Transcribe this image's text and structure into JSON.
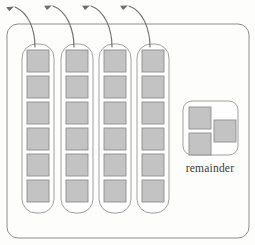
{
  "diagram": {
    "background_color": "#fdfdfc",
    "outer_container": {
      "name": "outer-container",
      "x": 7,
      "y": 24,
      "width": 242,
      "height": 214,
      "corner_radius": 11,
      "stroke": "#8d8d8d",
      "fill": "#fdfdfc"
    },
    "columns": {
      "count": 4,
      "squares_per_column": 6,
      "box_width": 32,
      "box_top": 44,
      "box_height": 169,
      "corner_radius": 14,
      "stroke": "#a0a0a0",
      "x_positions": [
        22,
        61,
        99,
        137
      ],
      "labels": [
        "column-1",
        "column-2",
        "column-3",
        "column-4"
      ],
      "square": {
        "size": 22,
        "gap": 4,
        "inset_x": 5,
        "inset_y": 6,
        "fill": "#c3c3c3",
        "stroke": "#8f8f8f"
      }
    },
    "remainder": {
      "label": "remainder",
      "label_x": 210,
      "label_y": 172,
      "box": {
        "x": 183,
        "y": 101,
        "width": 55,
        "height": 54,
        "corner_radius": 9,
        "stroke": "#a0a0a0",
        "fill": "#fefefe"
      },
      "squares": [
        {
          "name": "remainder-square-1",
          "x": 189,
          "y": 107,
          "size": 22
        },
        {
          "name": "remainder-square-2",
          "x": 189,
          "y": 133,
          "size": 22
        },
        {
          "name": "remainder-square-3",
          "x": 214,
          "y": 120,
          "size": 22
        }
      ],
      "square_count": 3
    },
    "arrows": {
      "count": 4,
      "stroke": "#6e6e6e",
      "description": "curved arrows pointing up-left from each column top",
      "items": [
        {
          "name": "arrow-to-column-1",
          "path": "M 35 47 C 35 30 29 13 15 7",
          "tip_x": 14,
          "tip_y": 6.5,
          "tip_angle": -205
        },
        {
          "name": "arrow-to-column-2",
          "path": "M 74 47 C 74 30 67 11 53 6",
          "tip_x": 52,
          "tip_y": 5.6,
          "tip_angle": -200
        },
        {
          "name": "arrow-to-column-3",
          "path": "M 112 47 C 112 29 105 11 91 6",
          "tip_x": 90,
          "tip_y": 5.6,
          "tip_angle": -200
        },
        {
          "name": "arrow-to-column-4",
          "path": "M 150 47 C 150 29 143 11 129 6",
          "tip_x": 128,
          "tip_y": 5.6,
          "tip_angle": -200
        }
      ]
    }
  }
}
